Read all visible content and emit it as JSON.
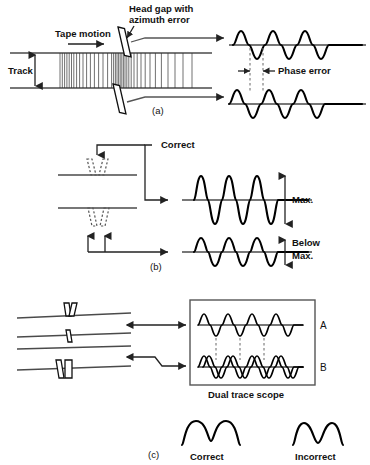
{
  "figure": {
    "ink_color": "#111111",
    "background_color": "#ffffff"
  },
  "panel_a": {
    "caption": "(a)",
    "labels": {
      "tape_motion": "Tape motion",
      "head_gap": "Head gap with\nazimuth error",
      "head_gap_line1": "Head gap with",
      "head_gap_line2": "azimuth error",
      "track": "Track",
      "phase_error": "Phase error"
    },
    "waveforms": [
      {
        "name": "upper-trace",
        "cycles": 3,
        "amplitude": 14,
        "phase_deg": 0
      },
      {
        "name": "lower-trace",
        "cycles": 3,
        "amplitude": 14,
        "phase_deg": 38
      }
    ]
  },
  "panel_b": {
    "caption": "(b)",
    "labels": {
      "correct": "Correct",
      "max": "Max.",
      "below": "Below",
      "below_max": "Max."
    },
    "waveforms": [
      {
        "name": "correct-azimuth-output",
        "cycles": 3,
        "amplitude": 22,
        "level": "Max."
      },
      {
        "name": "incorrect-azimuth-output",
        "cycles": 3,
        "amplitude": 13,
        "level": "Below Max."
      }
    ]
  },
  "panel_c": {
    "caption": "(c)",
    "labels": {
      "trace_a": "A",
      "trace_b": "B",
      "scope": "Dual trace scope",
      "correct": "Correct",
      "incorrect": "Incorrect"
    },
    "waveforms": [
      {
        "name": "scope-trace-a",
        "cycles": 3.5,
        "amplitude": 11,
        "phase_deg": 0
      },
      {
        "name": "scope-trace-b1",
        "cycles": 3.5,
        "amplitude": 11,
        "phase_deg": 0
      },
      {
        "name": "scope-trace-b2",
        "cycles": 3.5,
        "amplitude": 11,
        "phase_deg": 30
      }
    ],
    "lissajous": [
      {
        "name": "correct-pattern",
        "label": "Correct",
        "shape": "two-round-humps"
      },
      {
        "name": "incorrect-pattern",
        "label": "Incorrect",
        "shape": "two-narrow-humps"
      }
    ]
  }
}
